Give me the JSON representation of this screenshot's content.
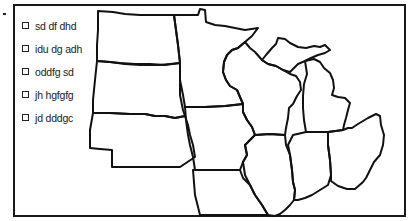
{
  "map": {
    "type": "outline-map",
    "region": "US Midwest",
    "regions": [
      "north-dakota",
      "south-dakota",
      "nebraska",
      "kansas",
      "minnesota",
      "iowa",
      "missouri",
      "wisconsin",
      "illinois",
      "michigan",
      "indiana",
      "ohio"
    ],
    "stroke_color": "#111111",
    "background": "#ffffff"
  },
  "legend": {
    "items": [
      {
        "label": "sd df dhd",
        "swatch": "square-outline"
      },
      {
        "label": "idu dg adh",
        "swatch": "square-outline"
      },
      {
        "label": "oddfg sd",
        "swatch": "square-outline"
      },
      {
        "label": "jh hgfgfg",
        "swatch": "square-outline"
      },
      {
        "label": "jd dddgc",
        "swatch": "square-outline"
      }
    ]
  }
}
